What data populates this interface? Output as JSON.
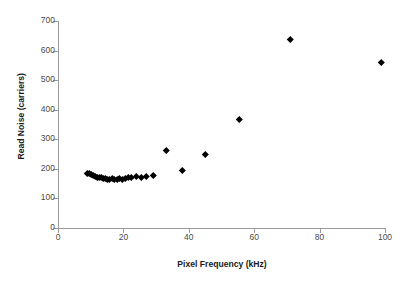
{
  "chart_data": {
    "type": "scatter",
    "title": "",
    "xlabel": "Pixel Frequency (kHz)",
    "ylabel": "Read Noise (carriers)",
    "xlim": [
      0,
      100
    ],
    "ylim": [
      0,
      700
    ],
    "xticks": [
      0,
      20,
      40,
      60,
      80,
      100
    ],
    "yticks": [
      0,
      100,
      200,
      300,
      400,
      500,
      600,
      700
    ],
    "grid": false,
    "legend": null,
    "marker": "diamond",
    "marker_color": "#000000",
    "series": [
      {
        "name": "Read noise vs pixel frequency",
        "points": [
          [
            9.0,
            186
          ],
          [
            9.6,
            184
          ],
          [
            10.2,
            181
          ],
          [
            10.8,
            178
          ],
          [
            11.4,
            176
          ],
          [
            12.0,
            173
          ],
          [
            12.6,
            171
          ],
          [
            13.2,
            170
          ],
          [
            13.8,
            168
          ],
          [
            14.4,
            167
          ],
          [
            15.0,
            166
          ],
          [
            15.8,
            165
          ],
          [
            16.5,
            168
          ],
          [
            17.2,
            166
          ],
          [
            18.0,
            165
          ],
          [
            18.8,
            167
          ],
          [
            19.6,
            166
          ],
          [
            20.5,
            169
          ],
          [
            21.5,
            172
          ],
          [
            22.5,
            171
          ],
          [
            24.0,
            174
          ],
          [
            25.5,
            173
          ],
          [
            27.0,
            176
          ],
          [
            29.0,
            178
          ],
          [
            33.0,
            263
          ],
          [
            38.0,
            196
          ],
          [
            45.0,
            250
          ],
          [
            55.5,
            367
          ],
          [
            71.0,
            638
          ],
          [
            99.0,
            560
          ]
        ]
      }
    ]
  },
  "axis": {
    "y_tick_labels": [
      "0",
      "100",
      "200",
      "300",
      "400",
      "500",
      "600",
      "700"
    ],
    "x_tick_labels": [
      "0",
      "20",
      "40",
      "60",
      "80",
      "100"
    ]
  }
}
